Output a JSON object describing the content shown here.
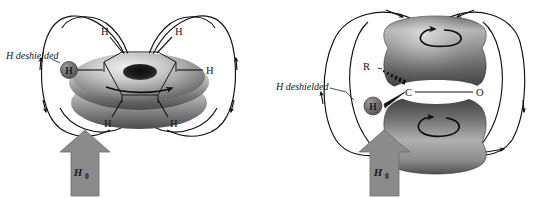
{
  "figure": {
    "background_color": "#ffffff",
    "panels": [
      {
        "id": "benzene-ring-current",
        "name": "benzene-torus-panel",
        "caption": "",
        "labels": {
          "deshielded": "H deshielded",
          "field_label": "H",
          "field_label_sub": "0",
          "hydrogen_in_circle": "H",
          "ring_hydrogens": [
            "H",
            "H",
            "H",
            "H",
            "H"
          ]
        },
        "colors": {
          "arrow_fill": "#8b8b8b",
          "arrow_stroke": "#6d6d6d",
          "atom_circle_fill": "#6f6f6f",
          "atom_circle_stroke": "#4a4a4a",
          "torus_light": "#e4e4e4",
          "torus_mid": "#9a9a9a",
          "torus_dark": "#4f4f4f",
          "field_line": "#111111"
        }
      },
      {
        "id": "carbonyl-pi-system",
        "name": "carbonyl-lobes-panel",
        "caption": "",
        "labels": {
          "deshielded": "H deshielded",
          "field_label": "H",
          "field_label_sub": "0",
          "hydrogen_in_circle": "H",
          "substituent": "R",
          "carbon": "C",
          "oxygen": "O"
        },
        "colors": {
          "arrow_fill": "#8b8b8b",
          "arrow_stroke": "#6d6d6d",
          "atom_circle_fill": "#6f6f6f",
          "atom_circle_stroke": "#4a4a4a",
          "lobe_light": "#efefef",
          "lobe_mid": "#979797",
          "lobe_dark": "#3f3f3f",
          "field_line": "#111111"
        }
      }
    ]
  }
}
